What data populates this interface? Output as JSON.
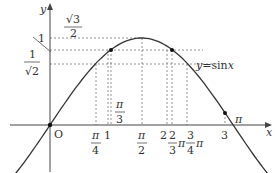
{
  "diagram": {
    "curve_label": "y=sin x",
    "curve_label_parts": {
      "y": "y",
      "eq": "=",
      "fn": "sin",
      "x": "x"
    },
    "axes": {
      "x": "x",
      "y": "y",
      "origin": "O"
    },
    "y_labels": {
      "one": "1",
      "sqrt3_num": "√3",
      "sqrt3_den": "2",
      "inv_sqrt2_num": "1",
      "inv_sqrt2_den": "√2"
    },
    "x_labels": {
      "pi4_num": "π",
      "pi4_den": "4",
      "one": "1",
      "pi3_num": "π",
      "pi3_den": "3",
      "pi2_num": "π",
      "pi2_den": "2",
      "two": "2",
      "tpi3_num": "2",
      "tpi3_den": "3",
      "tpi3_pi": "π",
      "tqpi4_num": "3",
      "tqpi4_den": "4",
      "tqpi4_pi": "π",
      "three": "3",
      "pi": "π"
    },
    "colors": {
      "curve": "#333333",
      "axis": "#444444",
      "guide": "#777777"
    }
  }
}
